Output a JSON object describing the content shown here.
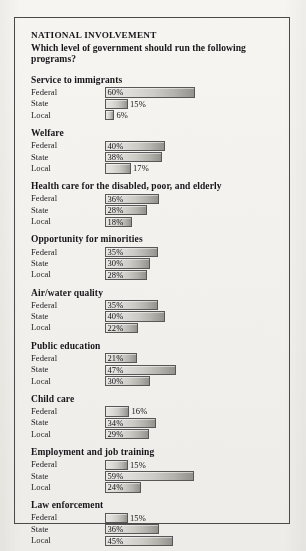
{
  "header": {
    "kicker": "NATIONAL INVOLVEMENT",
    "question": "Which level of government should run the following programs?"
  },
  "chart_data": {
    "type": "bar",
    "title": "NATIONAL INVOLVEMENT",
    "subtitle": "Which level of government should run the following programs?",
    "xlabel": "",
    "ylabel": "",
    "xlim": [
      0,
      60
    ],
    "grid": false,
    "legend": false,
    "orientation": "horizontal",
    "value_suffix": "%",
    "categories": [
      "Federal",
      "State",
      "Local"
    ],
    "groups": [
      {
        "label": "Service to immigrants",
        "values": [
          60,
          15,
          6
        ],
        "labels": [
          "60%",
          "15%",
          "6%"
        ]
      },
      {
        "label": "Welfare",
        "values": [
          40,
          38,
          17
        ],
        "labels": [
          "40%",
          "38%",
          "17%"
        ]
      },
      {
        "label": "Health care for the disabled, poor, and elderly",
        "values": [
          36,
          28,
          18
        ],
        "labels": [
          "36%",
          "28%",
          "18%"
        ]
      },
      {
        "label": "Opportunity for minorities",
        "values": [
          35,
          30,
          28
        ],
        "labels": [
          "35%",
          "30%",
          "28%"
        ]
      },
      {
        "label": "Air/water quality",
        "values": [
          35,
          40,
          22
        ],
        "labels": [
          "35%",
          "40%",
          "22%"
        ]
      },
      {
        "label": "Public education",
        "values": [
          21,
          47,
          30
        ],
        "labels": [
          "21%",
          "47%",
          "30%"
        ]
      },
      {
        "label": "Child care",
        "values": [
          16,
          34,
          29
        ],
        "labels": [
          "16%",
          "34%",
          "29%"
        ]
      },
      {
        "label": "Employment and job training",
        "values": [
          15,
          59,
          24
        ],
        "labels": [
          "15%",
          "59%",
          "24%"
        ]
      },
      {
        "label": "Law enforcement",
        "values": [
          15,
          36,
          45
        ],
        "labels": [
          "15%",
          "36%",
          "45%"
        ]
      }
    ]
  },
  "style": {
    "paper_color": "#f4f3f0",
    "rule_color": "#4a4a4a",
    "text_color": "#18181a",
    "bar_border_color": "#575757",
    "bar_fill_light": "#e7e6e3",
    "bar_fill_dark": "#94928c"
  }
}
